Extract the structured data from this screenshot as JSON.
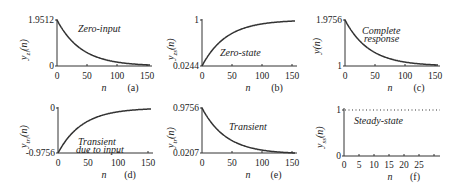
{
  "chart_data": [
    {
      "id": "a",
      "type": "line",
      "caption": "(a)",
      "xlabel": "n",
      "ylabel": "y_zi(n)",
      "annotation": [
        "Zero-input"
      ],
      "xlim": [
        0,
        155
      ],
      "ylim": [
        0,
        1.9512
      ],
      "xticks": [
        "0",
        "50",
        "100",
        "150"
      ],
      "yticks": [
        "0",
        "1.9512"
      ],
      "formula": "1.9512*0.9756^n",
      "x": [
        0,
        25,
        50,
        75,
        100,
        125,
        150
      ],
      "values": [
        1.9512,
        1.0592,
        0.575,
        0.3121,
        0.1694,
        0.092,
        0.0499
      ]
    },
    {
      "id": "b",
      "type": "line",
      "caption": "(b)",
      "xlabel": "n",
      "ylabel": "y_zs(n)",
      "annotation": [
        "Zero-state"
      ],
      "xlim": [
        0,
        155
      ],
      "ylim": [
        0.0244,
        1
      ],
      "xticks": [
        "0",
        "50",
        "100",
        "150"
      ],
      "yticks": [
        "0.0244",
        "1"
      ],
      "formula": "1-0.9756*0.9756^n",
      "x": [
        0,
        25,
        50,
        75,
        100,
        125,
        150
      ],
      "values": [
        0.0244,
        0.4704,
        0.7125,
        0.844,
        0.9153,
        0.954,
        0.975
      ]
    },
    {
      "id": "c",
      "type": "line",
      "caption": "(c)",
      "xlabel": "n",
      "ylabel": "y(n)",
      "annotation": [
        "Complete",
        "response"
      ],
      "xlim": [
        0,
        155
      ],
      "ylim": [
        1,
        1.9756
      ],
      "xticks": [
        "0",
        "50",
        "100",
        "150"
      ],
      "yticks": [
        "1",
        "1.9756"
      ],
      "formula": "1+0.9756*0.9756^n",
      "x": [
        0,
        25,
        50,
        75,
        100,
        125,
        150
      ],
      "values": [
        1.9756,
        1.5296,
        1.2875,
        1.156,
        1.0847,
        1.046,
        1.025
      ]
    },
    {
      "id": "d",
      "type": "line",
      "caption": "(d)",
      "xlabel": "n",
      "ylabel": "y_tri(n)",
      "annotation": [
        "Transient",
        "due to input"
      ],
      "xlim": [
        0,
        155
      ],
      "ylim": [
        -0.9756,
        0
      ],
      "xticks": [
        "0",
        "50",
        "100",
        "150"
      ],
      "yticks": [
        "-0.9756",
        "0"
      ],
      "formula": "-0.9756*0.9756^n",
      "x": [
        0,
        25,
        50,
        75,
        100,
        125,
        150
      ],
      "values": [
        -0.9756,
        -0.5296,
        -0.2875,
        -0.156,
        -0.0847,
        -0.046,
        -0.025
      ]
    },
    {
      "id": "e",
      "type": "line",
      "caption": "(e)",
      "xlabel": "n",
      "ylabel": "y_tr(n)",
      "annotation": [
        "Transient"
      ],
      "xlim": [
        0,
        155
      ],
      "ylim": [
        0.0207,
        0.9756
      ],
      "xticks": [
        "0",
        "50",
        "100",
        "150"
      ],
      "yticks": [
        "0.0207",
        "0.9756"
      ],
      "formula": "0.9756*0.9756^n",
      "x": [
        0,
        25,
        50,
        75,
        100,
        125,
        150
      ],
      "values": [
        0.9756,
        0.5296,
        0.2875,
        0.156,
        0.0847,
        0.046,
        0.025
      ]
    },
    {
      "id": "f",
      "type": "line",
      "caption": "(f)",
      "xlabel": "n",
      "ylabel": "y_ss(n)",
      "annotation": [
        "Steady-state"
      ],
      "xlim": [
        0,
        25
      ],
      "ylim": [
        0,
        1
      ],
      "xticks": [
        "0",
        "5",
        "10",
        "15",
        "20",
        "25"
      ],
      "yticks": [
        "0",
        "1"
      ],
      "line_style": "dotted",
      "x": [
        0,
        5,
        10,
        15,
        20,
        25
      ],
      "values": [
        1,
        1,
        1,
        1,
        1,
        1
      ]
    }
  ],
  "labels": {
    "a": {
      "ytop": "1.9512",
      "ybot": "0",
      "ylab_main": "y",
      "ylab_sub": "zi",
      "ylab_arg": "(n)",
      "ann1": "Zero-input",
      "ann2": "",
      "cap": "(a)",
      "n": "n",
      "xt": [
        "0",
        "50",
        "100",
        "150"
      ]
    },
    "b": {
      "ytop": "1",
      "ybot": "0.0244",
      "ylab_main": "y",
      "ylab_sub": "zs",
      "ylab_arg": "(n)",
      "ann1": "Zero-state",
      "ann2": "",
      "cap": "(b)",
      "n": "n",
      "xt": [
        "0",
        "50",
        "100",
        "150"
      ]
    },
    "c": {
      "ytop": "1.9756",
      "ybot": "1",
      "ylab_main": "y(n)",
      "ylab_sub": "",
      "ylab_arg": "",
      "ann1": "Complete",
      "ann2": "response",
      "cap": "(c)",
      "n": "n",
      "xt": [
        "0",
        "50",
        "100",
        "150"
      ]
    },
    "d": {
      "ytop": "0",
      "ybot": "-0.9756",
      "ylab_main": "y",
      "ylab_sub": "tri",
      "ylab_arg": "(n)",
      "ann1": "Transient",
      "ann2": "due to input",
      "cap": "(d)",
      "n": "n",
      "xt": [
        "0",
        "50",
        "100",
        "150"
      ]
    },
    "e": {
      "ytop": "0.9756",
      "ybot": "0.0207",
      "ylab_main": "y",
      "ylab_sub": "tr",
      "ylab_arg": "(n)",
      "ann1": "Transient",
      "ann2": "",
      "cap": "(e)",
      "n": "n",
      "xt": [
        "0",
        "50",
        "100",
        "150"
      ]
    },
    "f": {
      "ytop": "1",
      "ybot": "0",
      "ylab_main": "y",
      "ylab_sub": "ss",
      "ylab_arg": "(n)",
      "ann1": "Steady-state",
      "ann2": "",
      "cap": "(f)",
      "n": "n",
      "xt": [
        "0",
        "5",
        "10",
        "15",
        "20",
        "25"
      ]
    }
  }
}
